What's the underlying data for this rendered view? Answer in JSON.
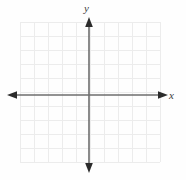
{
  "figure": {
    "kind": "cartesian-coordinate-plane",
    "width": 186,
    "height": 180,
    "background_color": "#fefefe"
  },
  "axes": {
    "x_label": "x",
    "y_label": "y",
    "axis_color": "#6e6e6e",
    "arrow_color": "#2b2b2b",
    "origin_px": {
      "x": 89,
      "y": 95
    },
    "x_axis_px": {
      "start": 8,
      "end": 167,
      "y": 95
    },
    "y_axis_px": {
      "start": 18,
      "end": 172,
      "x": 89
    },
    "arrowheads": [
      "left",
      "right",
      "up",
      "down"
    ],
    "tick_labels": [],
    "has_tick_marks": false
  },
  "grid": {
    "color": "#ececec",
    "left_px": 20,
    "top_px": 22,
    "width_px": 140,
    "height_px": 140,
    "columns": 10,
    "rows": 10,
    "cell_size_px": 14,
    "visible": true
  },
  "chart_data": {
    "type": "scatter",
    "title": "",
    "subtitle": "",
    "xlabel": "x",
    "ylabel": "y",
    "xlim": [
      -5,
      5
    ],
    "ylim": [
      -5,
      5
    ],
    "xticks": [
      -5,
      -4,
      -3,
      -2,
      -1,
      0,
      1,
      2,
      3,
      4,
      5
    ],
    "yticks": [
      -5,
      -4,
      -3,
      -2,
      -1,
      0,
      1,
      2,
      3,
      4,
      5
    ],
    "xticklabels": [],
    "yticklabels": [],
    "grid": true,
    "legend": null,
    "annotations": [],
    "series": [
      {
        "name": "",
        "x": [],
        "y": []
      }
    ]
  }
}
